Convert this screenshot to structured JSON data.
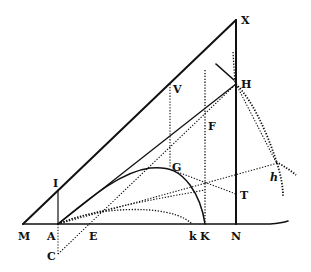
{
  "figure": {
    "type": "geometric-diagram",
    "ink_color": "#111111",
    "background": "#ffffff",
    "labels": {
      "X": "X",
      "H": "H",
      "V": "V",
      "F": "F",
      "G": "G",
      "I": "I",
      "T": "T",
      "h": "h",
      "M": "M",
      "A": "A",
      "E": "E",
      "k": "k",
      "K": "K",
      "N": "N",
      "C": "C"
    }
  }
}
